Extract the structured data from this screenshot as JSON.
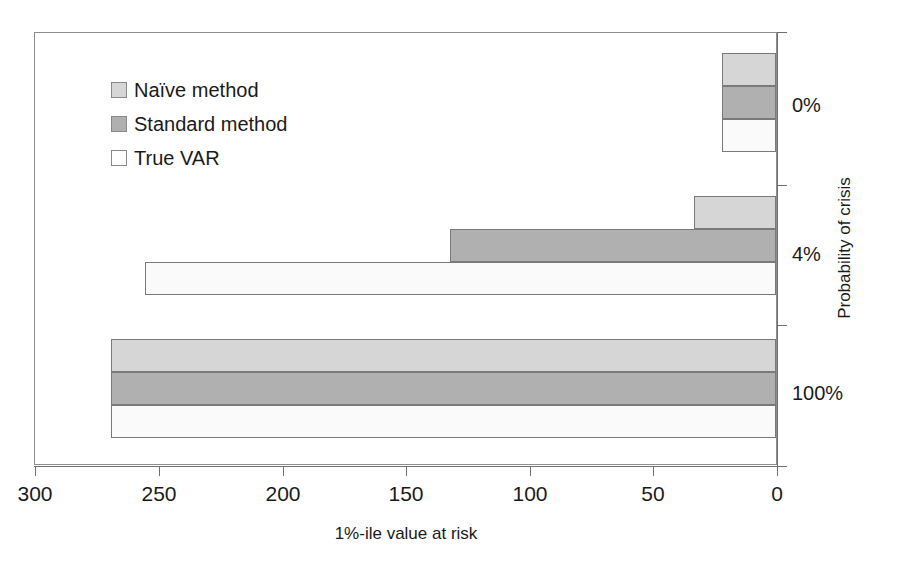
{
  "chart_data": {
    "type": "bar",
    "orientation": "horizontal",
    "title": "",
    "xlabel": "1%-ile value at risk",
    "ylabel": "Probability of crisis",
    "categories": [
      "0%",
      "4%",
      "100%"
    ],
    "series": [
      {
        "name": "Naïve method",
        "color": "#d6d6d6",
        "values": [
          22,
          33,
          269
        ]
      },
      {
        "name": "Standard method",
        "color": "#b0b0b0",
        "values": [
          22,
          132,
          269
        ]
      },
      {
        "name": "True VAR",
        "color": "#fafafa",
        "values": [
          22,
          255,
          269
        ]
      }
    ],
    "xlim": [
      300,
      0
    ],
    "x_reversed": true,
    "xticks": [
      300,
      250,
      200,
      150,
      100,
      50,
      0
    ],
    "xtick_labels": [
      "300",
      "250",
      "200",
      "150",
      "100",
      "50",
      "0"
    ],
    "grid": false,
    "legend_position": "upper-left-inside",
    "y_axis_position": "right"
  },
  "legend": {
    "items": [
      {
        "label": "Naïve method"
      },
      {
        "label": "Standard method"
      },
      {
        "label": "True VAR"
      }
    ]
  },
  "axes": {
    "x": {
      "title": "1%-ile value at risk",
      "ticks": [
        {
          "label": "300"
        },
        {
          "label": "250"
        },
        {
          "label": "200"
        },
        {
          "label": "150"
        },
        {
          "label": "100"
        },
        {
          "label": "50"
        },
        {
          "label": "0"
        }
      ]
    },
    "y": {
      "title": "Probability of crisis",
      "ticks": [
        {
          "label": "0%"
        },
        {
          "label": "4%"
        },
        {
          "label": "100%"
        }
      ]
    }
  },
  "colors": {
    "naive": "#d6d6d6",
    "standard": "#b0b0b0",
    "truevar": "#fafafa",
    "axis": "#6f6f6f",
    "bar_outline": "#7a7a7a",
    "text": "#1a1a1a"
  }
}
